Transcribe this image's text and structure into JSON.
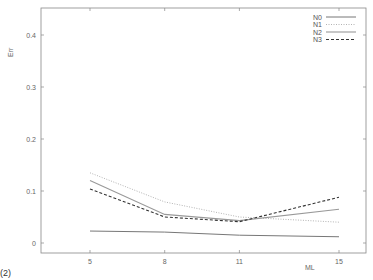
{
  "chart_data": {
    "type": "line",
    "title": "",
    "xlabel": "ML",
    "ylabel": "Err",
    "x": [
      5,
      8,
      11,
      15
    ],
    "xticks": [
      "5",
      "8",
      "11",
      "15"
    ],
    "yticks": [
      "0",
      "0.1",
      "0.2",
      "0.3",
      "0.4"
    ],
    "xlim": [
      0,
      16
    ],
    "ylim": [
      -0.02,
      0.45
    ],
    "grid": false,
    "legend_position": "top-right",
    "series": [
      {
        "name": "N0",
        "style": "solid",
        "color": "#777777",
        "values": [
          0.023,
          0.021,
          0.015,
          0.012
        ]
      },
      {
        "name": "N1",
        "style": "dotted",
        "color": "#aaaaaa",
        "values": [
          0.135,
          0.079,
          0.05,
          0.04
        ]
      },
      {
        "name": "N2",
        "style": "solid-light",
        "color": "#999999",
        "values": [
          0.12,
          0.055,
          0.043,
          0.065
        ]
      },
      {
        "name": "N3",
        "style": "dashed",
        "color": "#333333",
        "values": [
          0.104,
          0.05,
          0.041,
          0.088
        ]
      }
    ]
  },
  "corner_label": "(2)"
}
